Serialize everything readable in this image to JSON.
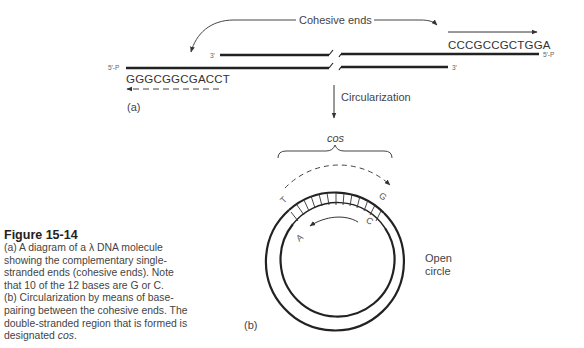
{
  "figure": {
    "title": "Figure 15-14",
    "caption_parts": {
      "line_a": "(a) A diagram of a λ DNA molecule showing the complementary single-stranded ends (cohesive ends). Note that 10 of the 12 bases are G or C.",
      "line_b": "(b) Circularization by means of base-pairing between the cohesive ends. The double-stranded region that is formed is designated ",
      "cos_term": "cos",
      "end": "."
    }
  },
  "panel_a": {
    "label": "(a)",
    "cohesive_ends_label": "Cohesive ends",
    "left_sequence": "GGGCGGCGACCT",
    "right_sequence": "CCCGCCGCTGGA",
    "left_5p": "5′-P",
    "left_3p": "3′",
    "right_5p": "5′-P",
    "right_3p": "3′",
    "step_label": "Circularization"
  },
  "panel_b": {
    "label": "(b)",
    "cos_label": "cos",
    "open_circle_label_line1": "Open",
    "open_circle_label_line2": "circle",
    "bases": {
      "outer_left": "T",
      "outer_right": "G",
      "inner_left": "A",
      "inner_right": "C"
    }
  }
}
